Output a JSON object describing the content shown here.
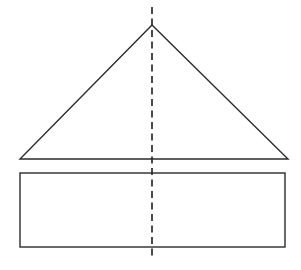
{
  "figure": {
    "canvas": {
      "width": 301,
      "height": 270,
      "background": "#ffffff"
    },
    "stroke_color": "#2b2b2b",
    "shapes": {
      "triangle": {
        "name": "isosceles-triangle",
        "points": "152,25 288,159 20,159",
        "apex": {
          "x": 152,
          "y": 25
        },
        "base_left": {
          "x": 20,
          "y": 159
        },
        "base_right": {
          "x": 288,
          "y": 159
        },
        "base_width": 268,
        "height": 134,
        "stroke_width": 1.4,
        "fill": "none"
      },
      "rectangle": {
        "name": "rectangle",
        "x": 20,
        "y": 173,
        "width": 265,
        "height": 74,
        "stroke_width": 1.4,
        "fill": "none"
      },
      "symmetry_axis": {
        "name": "vertical-dashed-line-of-symmetry",
        "x": 152,
        "y_start": 7,
        "y_end": 259,
        "stroke_width": 1.7,
        "dash_pattern": "7,4.5"
      }
    }
  }
}
